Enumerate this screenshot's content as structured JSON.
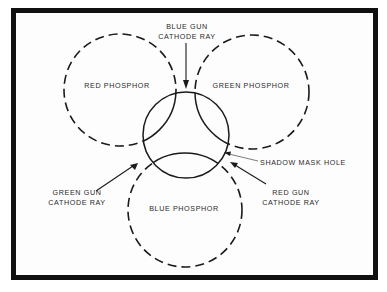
{
  "diagram": {
    "frame": {
      "border_color": "#111111",
      "background": "#fdfdfd"
    },
    "phosphors": [
      {
        "id": "red",
        "label": "RED PHOSPHOR",
        "cx": 120,
        "cy": 90,
        "r": 56,
        "style": "dashed"
      },
      {
        "id": "green",
        "label": "GREEN PHOSPHOR",
        "cx": 252,
        "cy": 92,
        "r": 57,
        "style": "dashed"
      },
      {
        "id": "blue",
        "label": "BLUE PHOSPHOR",
        "cx": 185,
        "cy": 210,
        "r": 57,
        "style": "dashed"
      }
    ],
    "shadow_mask_hole": {
      "label": "SHADOW MASK HOLE",
      "cx": 186,
      "cy": 135,
      "r": 43,
      "style": "solid"
    },
    "cathode_rays": {
      "blue": {
        "line1": "BLUE GUN",
        "line2": "CATHODE RAY"
      },
      "red": {
        "line1": "RED GUN",
        "line2": "CATHODE RAY"
      },
      "green": {
        "line1": "GREEN GUN",
        "line2": "CATHODE RAY"
      }
    }
  }
}
